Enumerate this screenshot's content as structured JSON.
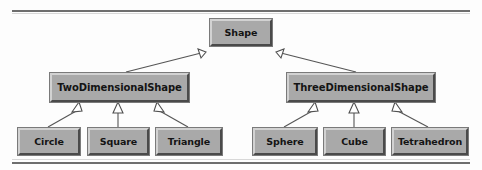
{
  "diagram": {
    "notation": "UML generalization (inheritance)",
    "background_color": "#fdfdfd",
    "node_fill_color": "#a9a9a9",
    "node_highlight_color": "#d2d2d2",
    "node_shadow_color": "#4a4a4a",
    "text_color": "#141414",
    "connector_color": "#555555",
    "arrowhead_fill": "#ffffff"
  },
  "nodes": {
    "root": {
      "label": "Shape"
    },
    "two_dimensional": {
      "label": "TwoDimensionalShape"
    },
    "three_dimensional": {
      "label": "ThreeDimensionalShape"
    },
    "circle": {
      "label": "Circle"
    },
    "square": {
      "label": "Square"
    },
    "triangle": {
      "label": "Triangle"
    },
    "sphere": {
      "label": "Sphere"
    },
    "cube": {
      "label": "Cube"
    },
    "tetrahedron": {
      "label": "Tetrahedron"
    }
  },
  "edges": [
    {
      "from": "TwoDimensionalShape",
      "to": "Shape",
      "type": "generalization"
    },
    {
      "from": "ThreeDimensionalShape",
      "to": "Shape",
      "type": "generalization"
    },
    {
      "from": "Circle",
      "to": "TwoDimensionalShape",
      "type": "generalization"
    },
    {
      "from": "Square",
      "to": "TwoDimensionalShape",
      "type": "generalization"
    },
    {
      "from": "Triangle",
      "to": "TwoDimensionalShape",
      "type": "generalization"
    },
    {
      "from": "Sphere",
      "to": "ThreeDimensionalShape",
      "type": "generalization"
    },
    {
      "from": "Cube",
      "to": "ThreeDimensionalShape",
      "type": "generalization"
    },
    {
      "from": "Tetrahedron",
      "to": "ThreeDimensionalShape",
      "type": "generalization"
    }
  ]
}
